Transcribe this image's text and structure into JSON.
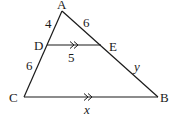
{
  "diagram": {
    "points": {
      "A": {
        "label": "A",
        "x": 62,
        "y": 11
      },
      "D": {
        "label": "D",
        "x": 47,
        "y": 45
      },
      "E": {
        "label": "E",
        "x": 101,
        "y": 45
      },
      "C": {
        "label": "C",
        "x": 24,
        "y": 97
      },
      "B": {
        "label": "B",
        "x": 158,
        "y": 97
      }
    },
    "segment_labels": {
      "AD": "4",
      "AE": "6",
      "DE": "5",
      "DC": "6",
      "EB": "y",
      "CB": "x"
    },
    "parallel_marks": [
      "DE",
      "CB"
    ]
  }
}
